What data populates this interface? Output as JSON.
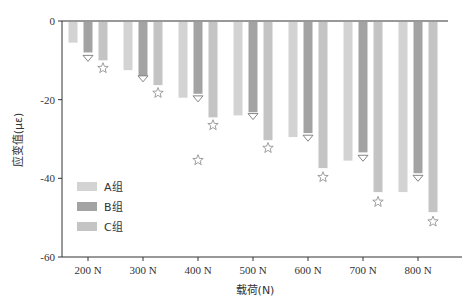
{
  "chart_data": {
    "type": "bar",
    "title": "",
    "xlabel": "载荷(N)",
    "ylabel": "应变值(με)",
    "categories": [
      "200 N",
      "300 N",
      "400 N",
      "500 N",
      "600 N",
      "700 N",
      "800 N"
    ],
    "ylim": [
      -60,
      0
    ],
    "yticks": [
      0,
      -20,
      -40,
      -60
    ],
    "ytick_labels": [
      "0",
      "-20",
      "-40",
      "-60"
    ],
    "grid": false,
    "legend_position": "bottom-left",
    "series": [
      {
        "name": "A组",
        "color": "#d3d3d3",
        "values": [
          -5.5,
          -12.5,
          -19.5,
          -24,
          -29.5,
          -35.5,
          -43.5
        ]
      },
      {
        "name": "B组",
        "color": "#a3a3a3",
        "values": [
          -8,
          -14,
          -18.5,
          -23.2,
          -28.5,
          -33.4,
          -38.7
        ]
      },
      {
        "name": "C组",
        "color": "#c4c4c4",
        "values": [
          -10,
          -16.3,
          -24.5,
          -30.3,
          -37.4,
          -43.5,
          -48.6
        ]
      }
    ],
    "markers": [
      {
        "series": "B组",
        "symbol": "triangle-down",
        "values": [
          -9.5,
          -14.7,
          -19.8,
          -24.3,
          -29.8,
          -34.9,
          -40
        ]
      },
      {
        "series": "C组",
        "symbol": "star",
        "values": [
          -12,
          -18.3,
          -26.5,
          -32.3,
          -39.7,
          -46,
          -51
        ]
      },
      {
        "series": "extra",
        "symbol": "star",
        "category": "400 N",
        "offset": "B",
        "value": -35.4
      }
    ]
  }
}
